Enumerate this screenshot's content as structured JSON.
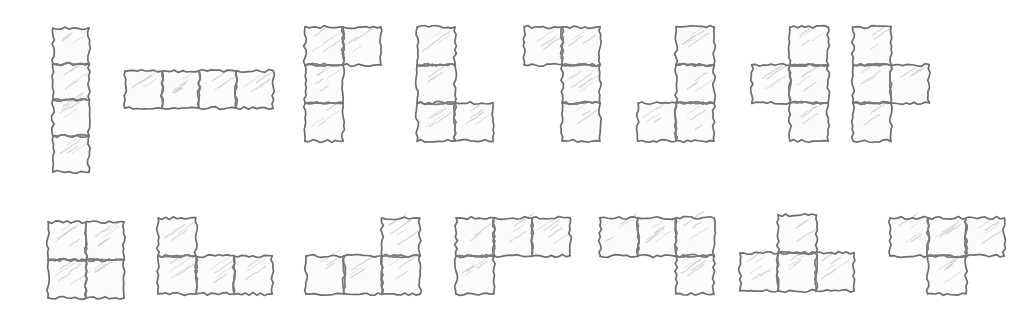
{
  "diagram": {
    "background_color": "#ffffff",
    "ink_color": "#6d6d6d",
    "fill_color": "#fbfbfa",
    "hatch_color": "#c9c9cc",
    "style": "pencil-sketch",
    "cell_size_px": 37,
    "rows": 2,
    "shape_count": 15
  },
  "shapes": [
    {
      "index": 1,
      "name": "I-tetromino-vertical",
      "label": "I vertical",
      "origin": [
        53,
        28
      ],
      "cell": 36,
      "cells": [
        [
          0,
          0
        ],
        [
          0,
          1
        ],
        [
          0,
          2
        ],
        [
          0,
          3
        ]
      ]
    },
    {
      "index": 2,
      "name": "I-tetromino-horizontal",
      "label": "I horizontal",
      "origin": [
        125,
        71
      ],
      "cell": 37,
      "cells": [
        [
          0,
          0
        ],
        [
          1,
          0
        ],
        [
          2,
          0
        ],
        [
          3,
          0
        ]
      ]
    },
    {
      "index": 3,
      "name": "J-tetromino-top-left",
      "label": "J rotated",
      "origin": [
        305,
        27
      ],
      "cell": 38,
      "cells": [
        [
          0,
          0
        ],
        [
          1,
          0
        ],
        [
          0,
          1
        ],
        [
          0,
          2
        ]
      ]
    },
    {
      "index": 4,
      "name": "L-tetromino-bottom-right",
      "label": "L rotated",
      "origin": [
        417,
        27
      ],
      "cell": 38,
      "cells": [
        [
          0,
          0
        ],
        [
          0,
          1
        ],
        [
          0,
          2
        ],
        [
          1,
          2
        ]
      ]
    },
    {
      "index": 5,
      "name": "J-tetromino-top-right",
      "label": "J rotated",
      "origin": [
        524,
        27
      ],
      "cell": 38,
      "cells": [
        [
          0,
          0
        ],
        [
          1,
          0
        ],
        [
          1,
          1
        ],
        [
          1,
          2
        ]
      ]
    },
    {
      "index": 6,
      "name": "J-tetromino-bottom-left",
      "label": "J rotated",
      "origin": [
        638,
        27
      ],
      "cell": 38,
      "cells": [
        [
          1,
          0
        ],
        [
          1,
          1
        ],
        [
          0,
          2
        ],
        [
          1,
          2
        ]
      ]
    },
    {
      "index": 7,
      "name": "T-tetromino-left-nub",
      "label": "T rotated",
      "origin": [
        752,
        27
      ],
      "cell": 38,
      "cells": [
        [
          1,
          0
        ],
        [
          0,
          1
        ],
        [
          1,
          1
        ],
        [
          1,
          2
        ]
      ]
    },
    {
      "index": 8,
      "name": "T-tetromino-right-nub",
      "label": "T rotated",
      "origin": [
        853,
        27
      ],
      "cell": 38,
      "cells": [
        [
          0,
          0
        ],
        [
          0,
          1
        ],
        [
          1,
          1
        ],
        [
          0,
          2
        ]
      ]
    },
    {
      "index": 9,
      "name": "O-tetromino-square",
      "label": "O square",
      "origin": [
        48,
        222
      ],
      "cell": 38,
      "cells": [
        [
          0,
          0
        ],
        [
          1,
          0
        ],
        [
          0,
          1
        ],
        [
          1,
          1
        ]
      ]
    },
    {
      "index": 10,
      "name": "J-tetromino-row-with-left-top",
      "label": "J rotated",
      "origin": [
        158,
        218
      ],
      "cell": 38,
      "cells": [
        [
          0,
          0
        ],
        [
          0,
          1
        ],
        [
          1,
          1
        ],
        [
          2,
          1
        ]
      ]
    },
    {
      "index": 11,
      "name": "L-tetromino-row-with-right-top",
      "label": "L rotated",
      "origin": [
        306,
        218
      ],
      "cell": 38,
      "cells": [
        [
          2,
          0
        ],
        [
          0,
          1
        ],
        [
          1,
          1
        ],
        [
          2,
          1
        ]
      ]
    },
    {
      "index": 12,
      "name": "J-tetromino-row-with-left-bottom",
      "label": "J rotated",
      "origin": [
        456,
        218
      ],
      "cell": 38,
      "cells": [
        [
          0,
          0
        ],
        [
          1,
          0
        ],
        [
          2,
          0
        ],
        [
          0,
          1
        ]
      ]
    },
    {
      "index": 13,
      "name": "S-tetromino-offset-row",
      "label": "S / L rotated",
      "origin": [
        600,
        218
      ],
      "cell": 38,
      "cells": [
        [
          0,
          0
        ],
        [
          1,
          0
        ],
        [
          2,
          0
        ],
        [
          2,
          1
        ]
      ]
    },
    {
      "index": 14,
      "name": "S-tetromino-step",
      "label": "S step",
      "origin": [
        740,
        215
      ],
      "cell": 38,
      "cells": [
        [
          1,
          0
        ],
        [
          0,
          1
        ],
        [
          1,
          1
        ],
        [
          2,
          1
        ]
      ]
    },
    {
      "index": 15,
      "name": "T-tetromino-down-nub",
      "label": "T upright",
      "origin": [
        890,
        218
      ],
      "cell": 38,
      "cells": [
        [
          0,
          0
        ],
        [
          1,
          0
        ],
        [
          2,
          0
        ],
        [
          1,
          1
        ]
      ]
    }
  ]
}
